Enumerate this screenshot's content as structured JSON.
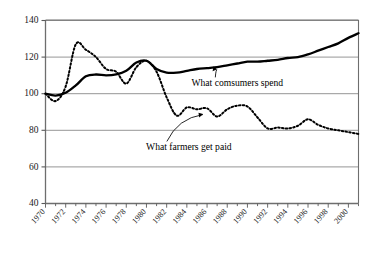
{
  "chart_data": {
    "type": "line",
    "title": "",
    "subtitle": "",
    "xlabel": "",
    "ylabel": "",
    "xlim": [
      1970,
      2001
    ],
    "ylim": [
      40,
      140
    ],
    "grid": true,
    "legend_position": "inline-annotations",
    "y_ticks": [
      40,
      60,
      80,
      100,
      120,
      140
    ],
    "y_tick_labels": [
      "40",
      "60",
      "80",
      "100",
      "120",
      "140"
    ],
    "x_ticks": [
      1970,
      1972,
      1974,
      1976,
      1978,
      1980,
      1982,
      1984,
      1986,
      1988,
      1990,
      1992,
      1994,
      1996,
      1998,
      2000
    ],
    "x_tick_labels": [
      "1970",
      "1972",
      "1974",
      "1976",
      "1978",
      "1980",
      "1982",
      "1984",
      "1986",
      "1988",
      "1990",
      "1992",
      "1994",
      "1996",
      "1998",
      "2000"
    ],
    "x_minor_tick_step": 1,
    "x": [
      1970,
      1971,
      1972,
      1973,
      1974,
      1975,
      1976,
      1977,
      1978,
      1979,
      1980,
      1981,
      1982,
      1983,
      1984,
      1985,
      1986,
      1987,
      1988,
      1989,
      1990,
      1991,
      1992,
      1993,
      1994,
      1995,
      1996,
      1997,
      1998,
      1999,
      2000,
      2001
    ],
    "series": [
      {
        "name": "What comsumers spend",
        "style": "solid",
        "color": "#000000",
        "values": [
          100,
          99.0,
          100.5,
          104.5,
          109.5,
          110.5,
          110.0,
          110.5,
          112.5,
          117.0,
          118.0,
          113.5,
          111.5,
          111.5,
          112.5,
          113.5,
          114.0,
          114.5,
          115.5,
          116.5,
          117.5,
          117.5,
          118.0,
          118.5,
          119.5,
          120.0,
          121.5,
          123.5,
          125.5,
          127.5,
          130.5,
          133.0
        ]
      },
      {
        "name": "What farmers get paid",
        "style": "dotted",
        "color": "#000000",
        "values": [
          100,
          96.0,
          104.0,
          127.0,
          124.0,
          120.0,
          113.5,
          112.0,
          105.5,
          114.5,
          118.0,
          112.0,
          98.0,
          88.0,
          92.5,
          91.5,
          92.0,
          87.5,
          91.5,
          93.5,
          93.0,
          87.0,
          81.0,
          81.5,
          81.0,
          82.5,
          86.0,
          83.0,
          81.0,
          80.0,
          79.0,
          78.0
        ]
      }
    ],
    "annotations": [
      {
        "id": "consumers",
        "text": "What comsumers spend",
        "label_x": 1989.0,
        "label_y": 104.0,
        "target_x": 1987.0,
        "target_y": 114.5
      },
      {
        "id": "farmers",
        "text": "What farmers get paid",
        "label_x": 1984.2,
        "label_y": 69.0,
        "target_x": 1985.6,
        "target_y": 90.0
      }
    ]
  }
}
